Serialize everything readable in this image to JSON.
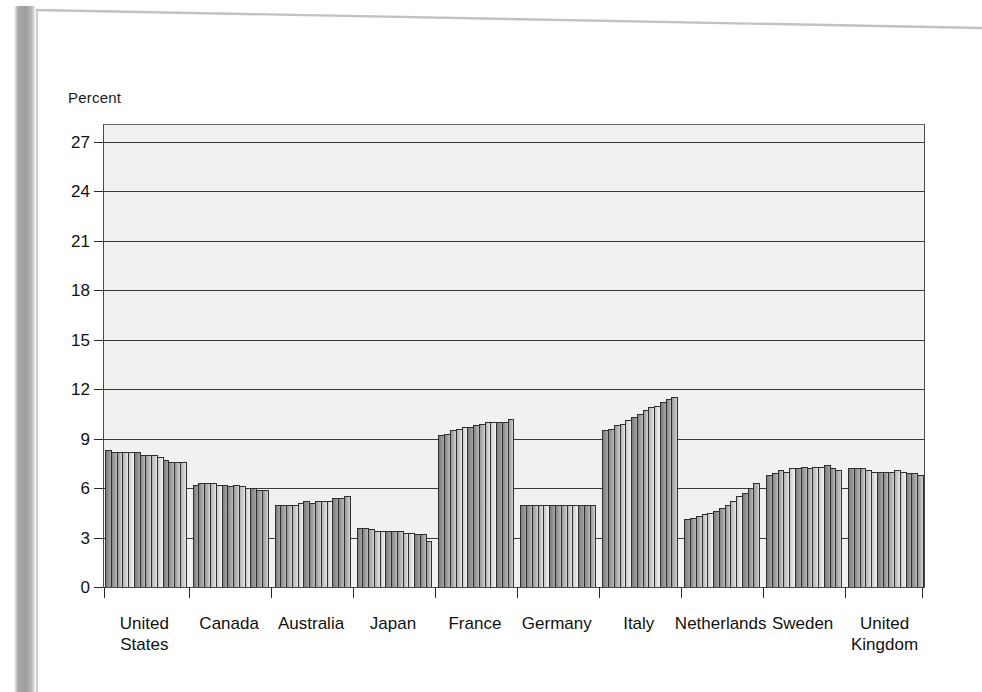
{
  "page": {
    "axis_title": "Percent"
  },
  "chart_data": {
    "type": "bar",
    "title": "Percent",
    "xlabel": "",
    "ylabel": "Percent",
    "ylim": [
      0,
      28
    ],
    "grid": true,
    "legend": "none",
    "yticks": [
      0,
      3,
      6,
      9,
      12,
      15,
      18,
      21,
      24,
      27
    ],
    "categories": [
      "United States",
      "Canada",
      "Australia",
      "Japan",
      "France",
      "Germany",
      "Italy",
      "Netherlands",
      "Sweden",
      "United Kingdom"
    ],
    "series_note": "each category shows a run of ~13 consecutive yearly bars",
    "groups": [
      {
        "label": "United\nStates",
        "values": [
          8.3,
          8.2,
          8.2,
          8.2,
          8.2,
          8.2,
          8.0,
          8.0,
          8.0,
          7.9,
          7.7,
          7.6,
          7.6,
          7.6
        ]
      },
      {
        "label": "Canada",
        "values": [
          6.2,
          6.3,
          6.3,
          6.3,
          6.2,
          6.2,
          6.1,
          6.2,
          6.1,
          6.0,
          6.0,
          5.9,
          5.9
        ]
      },
      {
        "label": "Australia",
        "values": [
          5.0,
          5.0,
          5.0,
          5.0,
          5.1,
          5.2,
          5.1,
          5.2,
          5.2,
          5.2,
          5.4,
          5.4,
          5.5
        ]
      },
      {
        "label": "Japan",
        "values": [
          3.6,
          3.6,
          3.5,
          3.4,
          3.4,
          3.4,
          3.4,
          3.4,
          3.3,
          3.3,
          3.2,
          3.2,
          2.8
        ]
      },
      {
        "label": "France",
        "values": [
          9.2,
          9.3,
          9.5,
          9.6,
          9.7,
          9.7,
          9.8,
          9.9,
          10.0,
          10.0,
          10.0,
          10.0,
          10.2
        ]
      },
      {
        "label": "Germany",
        "values": [
          5.0,
          5.0,
          5.0,
          5.0,
          5.0,
          5.0,
          5.0,
          5.0,
          5.0,
          5.0,
          5.0,
          5.0,
          5.0
        ]
      },
      {
        "label": "Italy",
        "values": [
          9.5,
          9.6,
          9.8,
          9.9,
          10.1,
          10.3,
          10.5,
          10.7,
          10.9,
          11.0,
          11.2,
          11.4,
          11.5
        ]
      },
      {
        "label": "Netherlands",
        "values": [
          4.1,
          4.2,
          4.3,
          4.4,
          4.5,
          4.6,
          4.8,
          5.0,
          5.2,
          5.5,
          5.7,
          6.0,
          6.3
        ]
      },
      {
        "label": "Sweden",
        "values": [
          6.8,
          6.9,
          7.1,
          7.0,
          7.2,
          7.2,
          7.3,
          7.2,
          7.3,
          7.3,
          7.4,
          7.2,
          7.1
        ]
      },
      {
        "label": "United\nKingdom",
        "values": [
          7.2,
          7.2,
          7.2,
          7.1,
          7.0,
          7.0,
          7.0,
          7.0,
          7.1,
          7.0,
          6.9,
          6.9,
          6.8
        ]
      }
    ]
  }
}
